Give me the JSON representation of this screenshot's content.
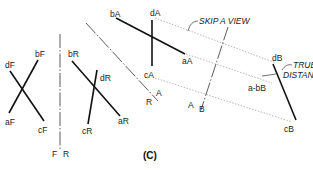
{
  "figure": {
    "caption": "(C)",
    "front_view": {
      "labels": {
        "d": "dF",
        "b": "bF",
        "a": "aF",
        "c": "cF"
      }
    },
    "fold_FR": {
      "label_left": "F",
      "label_right": "R",
      "separator": "|"
    },
    "right_view": {
      "labels": {
        "b": "bR",
        "d": "dR",
        "c": "cR",
        "a": "aR"
      }
    },
    "fold_RA": {
      "label_a": "A",
      "label_r": "R"
    },
    "aux_view_A": {
      "labels": {
        "b": "bA",
        "d": "dA",
        "c": "cA",
        "a": "aA"
      }
    },
    "fold_AB": {
      "label_a": "A",
      "label_b": "B",
      "separator": "/"
    },
    "view_B": {
      "labels": {
        "d": "dB",
        "c": "cB",
        "ab": "a-bB"
      }
    },
    "notes": {
      "skip": "SKIP A VIEW",
      "true_line1": "TRUE",
      "true_line2": "DISTANCE"
    }
  }
}
